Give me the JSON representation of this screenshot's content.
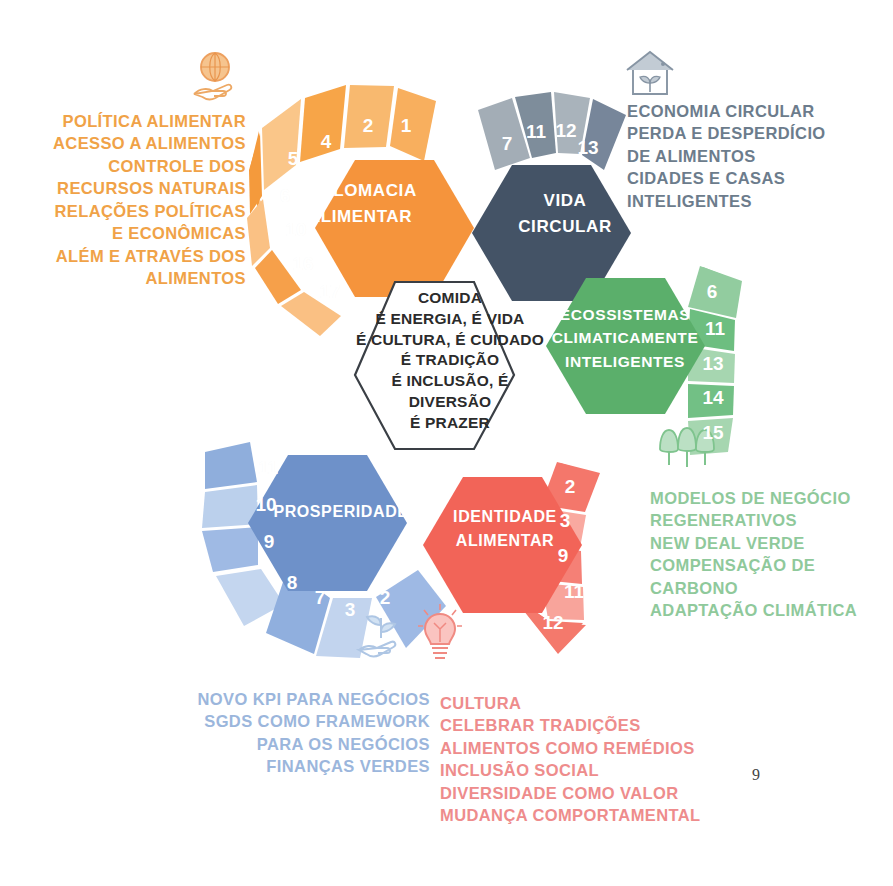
{
  "page": {
    "number": "9"
  },
  "center": {
    "text": "COMIDA\nÉ ENERGIA, É VIDA\nÉ CULTURA, É CUIDADO\nÉ TRADIÇÃO\nÉ INCLUSÃO, É\nDIVERSÃO\nÉ PRAZER"
  },
  "hexagons": [
    {
      "id": "diplomacia",
      "label": "DIPLOMACIA\nALIMENTAR",
      "color": "#F5943C",
      "petals": [
        "1",
        "2",
        "4",
        "5",
        "6",
        "10",
        "16",
        "17"
      ]
    },
    {
      "id": "vida-circular",
      "label": "VIDA\nCIRCULAR",
      "color": "#445366",
      "petals": [
        "7",
        "11",
        "12",
        "13"
      ]
    },
    {
      "id": "ecossistemas",
      "label": "ECOSSISTEMAS\nCLIMATICAMENTE\nINTELIGENTES",
      "color": "#5BAF6B",
      "petals": [
        "6",
        "11",
        "13",
        "14",
        "15"
      ]
    },
    {
      "id": "identidade",
      "label": "IDENTIDADE\nALIMENTAR",
      "color": "#F26458",
      "petals": [
        "2",
        "3",
        "9",
        "11",
        "12"
      ]
    },
    {
      "id": "prosperidade",
      "label": "PROSPERIDADE",
      "color": "#6E91C9",
      "petals": [
        "11",
        "10",
        "9",
        "8",
        "7",
        "3",
        "2"
      ]
    }
  ],
  "text_blocks": {
    "policy": {
      "color": "#F0A247",
      "text": "POLÍTICA ALIMENTAR\nACESSO A ALIMENTOS\nCONTROLE DOS\nRECURSOS NATURAIS\nRELAÇÕES POLÍTICAS\nE ECONÔMICAS\nALÉM E ATRAVÉS DOS\nALIMENTOS"
    },
    "circular": {
      "color": "#6C7C8C",
      "text": "ECONOMIA CIRCULAR\nPERDA E DESPERDÍCIO\nDE ALIMENTOS\nCIDADES E CASAS\nINTELIGENTES"
    },
    "green": {
      "color": "#8FC99B",
      "text": "MODELOS DE NEGÓCIO\nREGENERATIVOS\nNEW DEAL VERDE\nCOMPENSAÇÃO DE\nCARBONO\nADAPTAÇÃO CLIMÁTICA"
    },
    "blue": {
      "color": "#9BB6DC",
      "text": "NOVO KPI PARA NEGÓCIOS\nSGDS COMO FRAMEWORK\nPARA OS NEGÓCIOS\nFINANÇAS VERDES"
    },
    "red": {
      "color": "#EE8C8C",
      "text": "CULTURA\nCELEBRAR TRADIÇÕES\nALIMENTOS COMO REMÉDIOS\nINCLUSÃO SOCIAL\nDIVERSIDADE COMO VALOR\nMUDANÇA COMPORTAMENTAL"
    }
  },
  "icons": [
    {
      "name": "globe-in-hand-icon",
      "color": "#F0A86A"
    },
    {
      "name": "house-with-plant-icon",
      "color": "#8795A4"
    },
    {
      "name": "three-trees-icon",
      "color": "#9BCFA6"
    },
    {
      "name": "sprout-in-hand-icon",
      "color": "#AEC6E4"
    },
    {
      "name": "lightbulb-icon",
      "color": "#F08A82"
    }
  ]
}
